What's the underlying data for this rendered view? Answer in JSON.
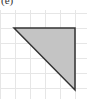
{
  "figure": {
    "label": "(e)",
    "grid": {
      "spacing": 15,
      "color": "#e6e6e6",
      "xs": [
        0,
        15,
        30,
        45,
        60,
        75
      ],
      "ys": [
        13,
        28,
        43,
        58,
        73,
        88
      ]
    },
    "triangle": {
      "points": "14,28 75,28 75,90",
      "fill": "#c4c4c4",
      "stroke": "#333333"
    }
  }
}
